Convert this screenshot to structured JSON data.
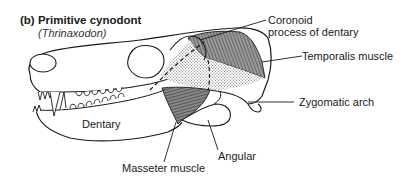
{
  "figure": {
    "panel": "(b)",
    "title": "Primitive cynodont",
    "subtitle": "(Thrinaxodon)"
  },
  "labels": {
    "coronoid": [
      "Coronoid",
      "process of dentary"
    ],
    "temporalis": "Temporalis muscle",
    "zygomatic": "Zygomatic arch",
    "dentary": "Dentary",
    "masseter": "Masseter muscle",
    "angular": "Angular"
  },
  "colors": {
    "line": "#1a1a1a",
    "muscle_fill": "#7a7a7a",
    "stipple": "#bdbdbd",
    "background": "#ffffff"
  }
}
